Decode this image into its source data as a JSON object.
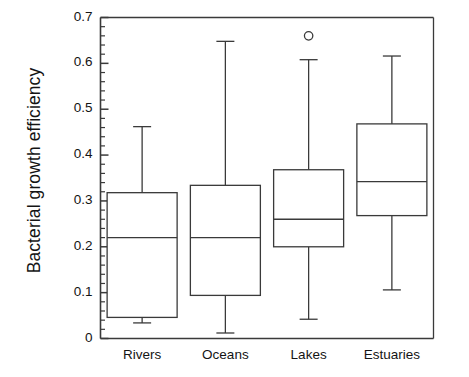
{
  "chart_data": {
    "type": "box",
    "title": "",
    "xlabel": "",
    "ylabel": "Bacterial growth efficiency",
    "ylim": [
      0,
      0.7
    ],
    "grid": false,
    "legend": null,
    "y_major_ticks": [
      0,
      0.1,
      0.2,
      0.3,
      0.4,
      0.5,
      0.6,
      0.7
    ],
    "y_major_tick_labels": [
      "0",
      "0.1",
      "0.2",
      "0.3",
      "0.4",
      "0.5",
      "0.6",
      "0.7"
    ],
    "y_minor_tick_step": 0.02,
    "categories": [
      "Rivers",
      "Oceans",
      "Lakes",
      "Estuaries"
    ],
    "boxes": [
      {
        "category": "Rivers",
        "whisker_low": 0.034,
        "q1": 0.046,
        "median": 0.22,
        "q3": 0.318,
        "whisker_high": 0.462,
        "outliers": []
      },
      {
        "category": "Oceans",
        "whisker_low": 0.012,
        "q1": 0.094,
        "median": 0.22,
        "q3": 0.334,
        "whisker_high": 0.648,
        "outliers": []
      },
      {
        "category": "Lakes",
        "whisker_low": 0.042,
        "q1": 0.2,
        "median": 0.26,
        "q3": 0.368,
        "whisker_high": 0.608,
        "outliers": [
          0.66
        ]
      },
      {
        "category": "Estuaries",
        "whisker_low": 0.106,
        "q1": 0.268,
        "median": 0.342,
        "q3": 0.468,
        "whisker_high": 0.616,
        "outliers": []
      }
    ],
    "colors": {
      "axis": "#3a3a3a",
      "box_stroke": "#3a3a3a",
      "box_fill": "#ffffff",
      "whisker": "#3a3a3a",
      "outlier_stroke": "#3a3a3a",
      "text": "#141414",
      "background": "#ffffff"
    }
  },
  "axes": {
    "y_title": "Bacterial growth efficiency"
  }
}
